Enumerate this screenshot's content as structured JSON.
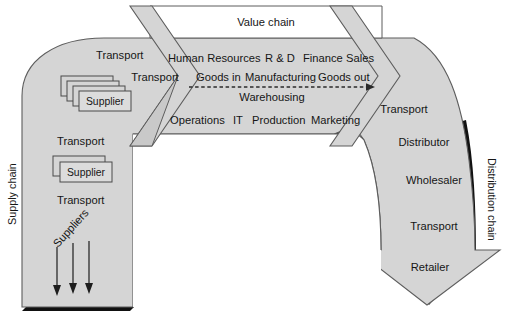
{
  "diagram": {
    "colors": {
      "fill": "#d5d5d5",
      "fill_light": "#dadada",
      "outline": "#5a5a5a",
      "shadow": "#111111",
      "inner": "#ffffff",
      "text": "#161616"
    },
    "top_band": {
      "label": "Value chain"
    },
    "value_chain_rows": {
      "row_top": [
        {
          "label": "Human Resources"
        },
        {
          "label": "R & D"
        },
        {
          "label": "Finance"
        },
        {
          "label": "Sales"
        }
      ],
      "row_flow": [
        {
          "label": "Goods in"
        },
        {
          "label": "Manufacturing"
        },
        {
          "label": "Goods out"
        }
      ],
      "row_flow_sub": {
        "label": "Warehousing"
      },
      "row_bottom": [
        {
          "label": "Operations"
        },
        {
          "label": "IT"
        },
        {
          "label": "Production"
        },
        {
          "label": "Marketing"
        }
      ]
    },
    "left_arm": {
      "side_label": "Supply chain",
      "items": [
        {
          "label": "Transport",
          "kind": "text"
        },
        {
          "label": "Supplier",
          "kind": "stack",
          "stack_count": 4
        },
        {
          "label": "Transport",
          "kind": "text"
        },
        {
          "label": "Supplier",
          "kind": "stack",
          "stack_count": 2
        },
        {
          "label": "Transport",
          "kind": "text"
        },
        {
          "label": "Suppliers",
          "kind": "rotated-arrows",
          "arrow_count": 3
        }
      ]
    },
    "right_arm": {
      "side_label": "Distribution chain",
      "items": [
        {
          "label": "Transport"
        },
        {
          "label": "Distributor"
        },
        {
          "label": "Wholesaler"
        },
        {
          "label": "Transport"
        },
        {
          "label": "Retailer"
        }
      ]
    },
    "left_chevron": {
      "label": "Transport"
    }
  }
}
